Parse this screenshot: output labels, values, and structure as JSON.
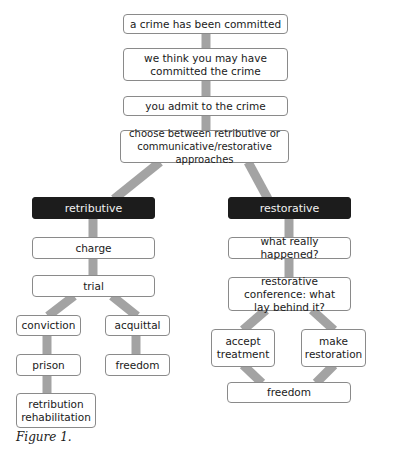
{
  "diagram": {
    "type": "flowchart",
    "colors": {
      "connector": "#a3a3a3",
      "node_border": "#8a8a8a",
      "node_fill": "#ffffff",
      "category_fill": "#1c1c1c",
      "category_text": "#f2f2f2"
    },
    "nodes": {
      "crime_committed": "a crime has been committed",
      "suspect": "we think you may have committed the crime",
      "admit": "you admit to the crime",
      "choose": "choose between retributive or communicative/restorative approaches",
      "retributive": "retributive",
      "charge": "charge",
      "trial": "trial",
      "conviction": "conviction",
      "acquittal": "acquittal",
      "prison": "prison",
      "freedom_left": "freedom",
      "retribution_rehabilitation": "retribution rehabilitation",
      "restorative": "restorative",
      "what_happened": "what really happened?",
      "conference": "restorative conference: what lay behind it?",
      "accept_treatment": "accept treatment",
      "make_restoration": "make restoration",
      "freedom_right": "freedom"
    },
    "edges": [
      [
        "crime_committed",
        "suspect"
      ],
      [
        "suspect",
        "admit"
      ],
      [
        "admit",
        "choose"
      ],
      [
        "choose",
        "retributive"
      ],
      [
        "choose",
        "restorative"
      ],
      [
        "retributive",
        "charge"
      ],
      [
        "charge",
        "trial"
      ],
      [
        "trial",
        "conviction"
      ],
      [
        "trial",
        "acquittal"
      ],
      [
        "conviction",
        "prison"
      ],
      [
        "prison",
        "retribution_rehabilitation"
      ],
      [
        "acquittal",
        "freedom_left"
      ],
      [
        "restorative",
        "what_happened"
      ],
      [
        "what_happened",
        "conference"
      ],
      [
        "conference",
        "accept_treatment"
      ],
      [
        "conference",
        "make_restoration"
      ],
      [
        "accept_treatment",
        "freedom_right"
      ],
      [
        "make_restoration",
        "freedom_right"
      ]
    ]
  },
  "caption": "Figure 1."
}
